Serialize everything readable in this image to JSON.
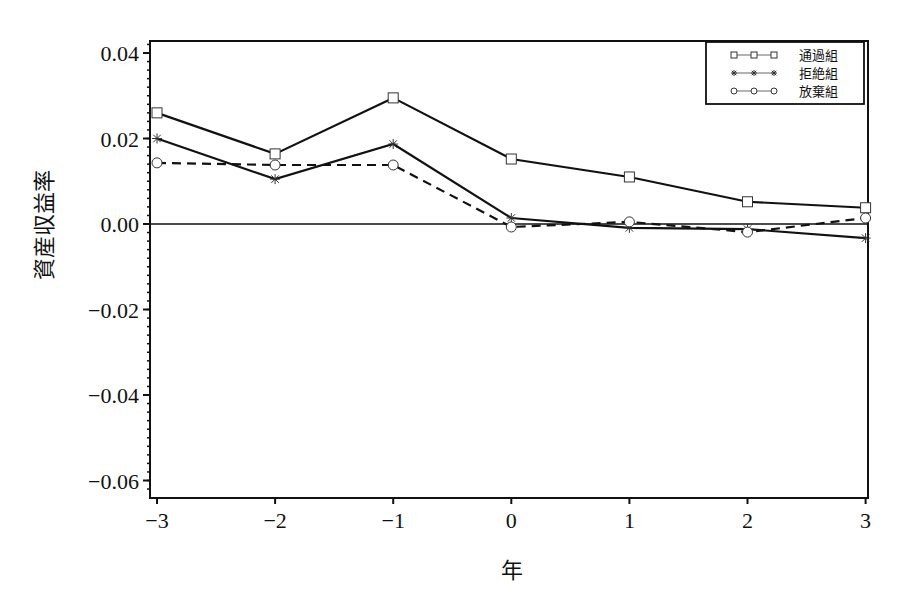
{
  "chart_data": {
    "type": "line",
    "title": "",
    "xlabel": "年",
    "ylabel": "資産収益率",
    "x": [
      -3,
      -2,
      -1,
      0,
      1,
      2,
      3
    ],
    "x_tick_labels": [
      "−3",
      "−2",
      "−1",
      "0",
      "1",
      "2",
      "3"
    ],
    "y_ticks": [
      0.04,
      0.02,
      0.0,
      -0.02,
      -0.04,
      -0.06
    ],
    "y_tick_labels": [
      "0.04",
      "0.02",
      "0.00",
      "−0.02",
      "−0.04",
      "−0.06"
    ],
    "xlim": [
      -3,
      3
    ],
    "ylim": [
      -0.062,
      0.043
    ],
    "grid": false,
    "reference_line_y": 0.0,
    "legend_position": "top-right",
    "series": [
      {
        "name": "通過組",
        "marker": "square",
        "line": "solid",
        "values": [
          0.026,
          0.0164,
          0.0295,
          0.0152,
          0.011,
          0.0052,
          0.0038
        ]
      },
      {
        "name": "拒絶組",
        "marker": "star",
        "line": "solid",
        "values": [
          0.02,
          0.0105,
          0.0187,
          0.0014,
          -0.0009,
          -0.0012,
          -0.0033
        ]
      },
      {
        "name": "放棄組",
        "marker": "circle",
        "line": "dashed",
        "values": [
          0.0143,
          0.0138,
          0.0138,
          -0.0007,
          0.0005,
          -0.0019,
          0.0014
        ]
      }
    ]
  }
}
